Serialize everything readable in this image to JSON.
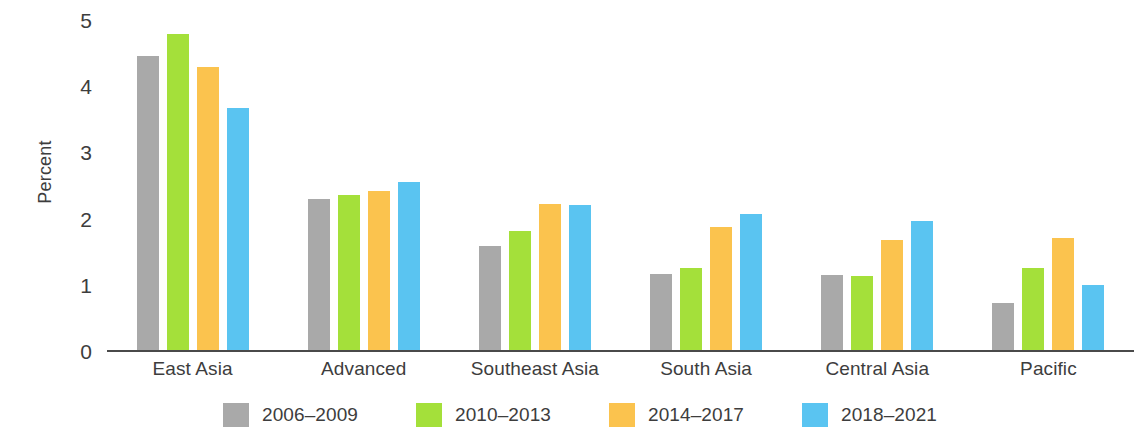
{
  "chart_data": {
    "type": "bar",
    "title": "",
    "xlabel": "",
    "ylabel": "Percent",
    "ylim": [
      0,
      5
    ],
    "yticks": [
      5,
      4,
      3,
      2,
      1,
      0
    ],
    "grid": false,
    "legend_position": "bottom",
    "categories": [
      "East Asia",
      "Advanced",
      "Southeast Asia",
      "South Asia",
      "Central Asia",
      "Pacific"
    ],
    "series": [
      {
        "name": "2006–2009",
        "color": "#a9a9a9",
        "values": [
          4.45,
          2.3,
          1.58,
          1.16,
          1.15,
          0.72
        ]
      },
      {
        "name": "2010–2013",
        "color": "#a4e03a",
        "values": [
          4.79,
          2.35,
          1.81,
          1.26,
          1.13,
          1.26
        ]
      },
      {
        "name": "2014–2017",
        "color": "#fbc34e",
        "values": [
          4.29,
          2.41,
          2.22,
          1.88,
          1.67,
          1.7
        ]
      },
      {
        "name": "2018–2021",
        "color": "#5ac4f1",
        "values": [
          3.67,
          2.55,
          2.21,
          2.07,
          1.96,
          1.0
        ]
      }
    ]
  },
  "axis": {
    "y_title": "Percent",
    "tick_labels": [
      "5",
      "4",
      "3",
      "2",
      "1",
      "0"
    ]
  },
  "colors": {
    "axis_line": "#4a4a4a",
    "text": "#3d3d3d",
    "background": "#ffffff"
  }
}
